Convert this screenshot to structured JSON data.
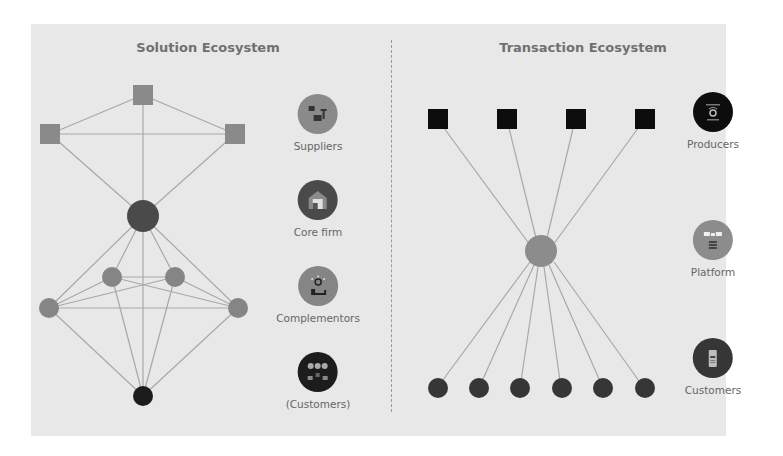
{
  "colors": {
    "panel_bg": "#e8e8e8",
    "edge": "#a8a8a8",
    "supplier": "#8a8a8a",
    "core_firm": "#4a4a4a",
    "complementor": "#858585",
    "customer_dark": "#1c1c1c",
    "producer": "#0d0d0d",
    "platform": "#8c8c8c",
    "tx_customer": "#363636"
  },
  "solution": {
    "title": "Solution Ecosystem",
    "legend": [
      {
        "label": "Suppliers",
        "icon": "suppliers-icon",
        "color": "#8a8a8a"
      },
      {
        "label": "Core firm",
        "icon": "core-firm-icon",
        "color": "#4a4a4a"
      },
      {
        "label": "Complementors",
        "icon": "complementors-icon",
        "color": "#858585"
      },
      {
        "label": "(Customers)",
        "icon": "customers-icon",
        "color": "#1c1c1c"
      }
    ]
  },
  "transaction": {
    "title": "Transaction Ecosystem",
    "legend": [
      {
        "label": "Producers",
        "icon": "producers-icon",
        "color": "#0d0d0d"
      },
      {
        "label": "Platform",
        "icon": "platform-icon",
        "color": "#8c8c8c"
      },
      {
        "label": "Customers",
        "icon": "customers-icon",
        "color": "#363636"
      }
    ]
  }
}
